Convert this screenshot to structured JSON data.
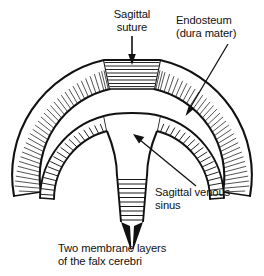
{
  "figure": {
    "background_color": "#ffffff",
    "ink_color": "#111111"
  },
  "labels": {
    "sagittal_suture": {
      "line1": "Sagittal",
      "line2": "suture"
    },
    "endosteum": {
      "line1": "Endosteum",
      "line2": "(dura mater)"
    },
    "sagittal_venous_sinus": {
      "line1": "Sagittal venous",
      "line2": "sinus"
    },
    "falx_cerebri": {
      "line1": "Two membrane layers",
      "line2": "of the falx cerebri"
    }
  },
  "structures": {
    "skull_bone": "skull-bone-band",
    "suture_block": "sagittal-suture-block",
    "dura_band": "endosteum-dura-band",
    "venous_sinus": "sagittal-venous-sinus-cavity",
    "falx": "falx-cerebri-strip"
  },
  "annotations": {
    "suture_arrow": "down-arrow",
    "endosteum_leader": "leader-line-with-arrowhead",
    "sinus_leader": "leader-line-with-arrowhead",
    "falx_arrow": "double-arrowhead"
  }
}
